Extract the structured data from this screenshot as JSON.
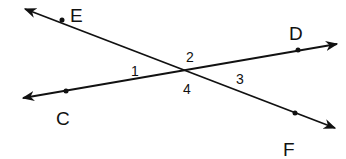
{
  "diagram": {
    "type": "intersecting-lines",
    "colors": {
      "line": "#111111",
      "background": "#ffffff"
    },
    "lines": [
      {
        "name": "EF",
        "from": [
          25,
          9
        ],
        "to": [
          335,
          128
        ],
        "arrow_both_ends": true,
        "points": [
          "E",
          "F"
        ]
      },
      {
        "name": "CD",
        "from": [
          23,
          98
        ],
        "to": [
          337,
          44
        ],
        "arrow_both_ends": true,
        "points": [
          "C",
          "D"
        ]
      }
    ],
    "intersection": [
      183,
      70
    ],
    "points": [
      {
        "id": "E",
        "label": "E",
        "dot": [
          62,
          20
        ],
        "label_pos": [
          70,
          22
        ]
      },
      {
        "id": "D",
        "label": "D",
        "dot": [
          298,
          50
        ],
        "label_pos": [
          289,
          40
        ]
      },
      {
        "id": "C",
        "label": "C",
        "dot": [
          66,
          91
        ],
        "label_pos": [
          56,
          125
        ]
      },
      {
        "id": "F",
        "label": "F",
        "dot": [
          295,
          113
        ],
        "label_pos": [
          283,
          156
        ]
      }
    ],
    "angles": [
      {
        "id": "1",
        "label": "1",
        "pos": [
          131,
          76
        ]
      },
      {
        "id": "2",
        "label": "2",
        "pos": [
          186,
          62
        ]
      },
      {
        "id": "3",
        "label": "3",
        "pos": [
          236,
          84
        ]
      },
      {
        "id": "4",
        "label": "4",
        "pos": [
          183,
          94
        ]
      }
    ]
  }
}
